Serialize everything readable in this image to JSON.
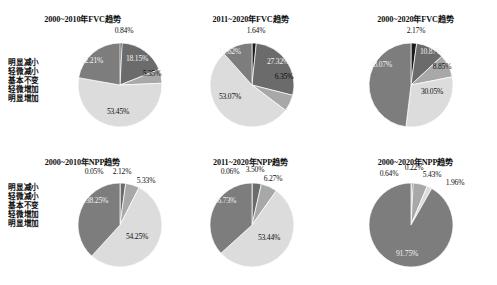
{
  "figure": {
    "background_color": "#ffffff",
    "legend_labels": [
      "明显减小",
      "轻微减小",
      "基本不变",
      "轻微增加",
      "明显增加"
    ],
    "slice_colors": [
      "#1c1c1c",
      "#6b6b6b",
      "#a8a8a8",
      "#dcdcdc",
      "#7d7d7d"
    ]
  },
  "chart_data": [
    {
      "type": "pie",
      "title": "2000~2010年FVC趋势",
      "categories": [
        "明显减小",
        "轻微减小",
        "基本不变",
        "轻微增加",
        "明显增加"
      ],
      "values": [
        0.84,
        18.15,
        5.35,
        53.45,
        22.21
      ],
      "labels": [
        "0.84%",
        "18.15%",
        "5.35%",
        "53.45%",
        "22.21%"
      ],
      "colors": [
        "#1c1c1c",
        "#6b6b6b",
        "#a8a8a8",
        "#dcdcdc",
        "#7d7d7d"
      ],
      "legend_position": "left"
    },
    {
      "type": "pie",
      "title": "2011~2020年FVC趋势",
      "categories": [
        "明显减小",
        "轻微减小",
        "基本不变",
        "轻微增加",
        "明显增加"
      ],
      "values": [
        1.64,
        27.32,
        6.35,
        53.07,
        11.62
      ],
      "labels": [
        "1.64%",
        "27.32%",
        "6.35%",
        "53.07%",
        "11.62%"
      ],
      "colors": [
        "#1c1c1c",
        "#6b6b6b",
        "#a8a8a8",
        "#dcdcdc",
        "#7d7d7d"
      ],
      "legend_position": "none"
    },
    {
      "type": "pie",
      "title": "2000~2020年FVC趋势",
      "categories": [
        "明显减小",
        "轻微减小",
        "基本不变",
        "轻微增加",
        "明显增加"
      ],
      "values": [
        2.17,
        10.87,
        8.85,
        30.05,
        48.07
      ],
      "labels": [
        "2.17%",
        "10.87%",
        "8.85%",
        "30.05%",
        "48.07%"
      ],
      "colors": [
        "#1c1c1c",
        "#6b6b6b",
        "#a8a8a8",
        "#dcdcdc",
        "#7d7d7d"
      ],
      "legend_position": "none"
    },
    {
      "type": "pie",
      "title": "2000~2010年NPP趋势",
      "categories": [
        "明显减小",
        "轻微减小",
        "基本不变",
        "轻微增加",
        "明显增加"
      ],
      "values": [
        0.05,
        2.12,
        5.33,
        54.25,
        38.25
      ],
      "labels": [
        "0.05%",
        "2.12%",
        "5.33%",
        "54.25%",
        "38.25%"
      ],
      "colors": [
        "#1c1c1c",
        "#6b6b6b",
        "#a8a8a8",
        "#dcdcdc",
        "#7d7d7d"
      ],
      "legend_position": "left"
    },
    {
      "type": "pie",
      "title": "2011~2020年NPP趋势",
      "categories": [
        "明显减小",
        "轻微减小",
        "基本不变",
        "轻微增加",
        "明显增加"
      ],
      "values": [
        0.06,
        3.5,
        6.27,
        53.44,
        36.73
      ],
      "labels": [
        "0.06%",
        "3.50%",
        "6.27%",
        "53.44%",
        "36.73%"
      ],
      "colors": [
        "#1c1c1c",
        "#6b6b6b",
        "#a8a8a8",
        "#dcdcdc",
        "#7d7d7d"
      ],
      "legend_position": "none"
    },
    {
      "type": "pie",
      "title": "2000~2020年NPP趋势",
      "categories": [
        "明显减小",
        "轻微减小",
        "基本不变",
        "轻微增加",
        "明显增加"
      ],
      "values": [
        0.22,
        0.64,
        5.43,
        1.96,
        91.75
      ],
      "labels": [
        "0.22%",
        "0.64%",
        "5.43%",
        "1.96%",
        "91.75%"
      ],
      "colors": [
        "#1c1c1c",
        "#6b6b6b",
        "#a8a8a8",
        "#dcdcdc",
        "#7d7d7d"
      ],
      "legend_position": "none"
    }
  ]
}
